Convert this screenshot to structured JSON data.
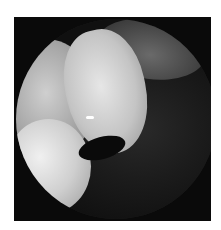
{
  "image": {
    "description": "Grayscale endoscopic view inside circular frame",
    "text_content": []
  }
}
